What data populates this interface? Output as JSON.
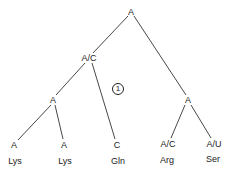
{
  "tree": {
    "nodes": {
      "root": {
        "label": "A"
      },
      "left_internal": {
        "label": "A/C"
      },
      "left_sub": {
        "label": "A"
      },
      "right_internal": {
        "label": "A"
      },
      "leaf1": {
        "label": "A",
        "amino_acid": "Lys"
      },
      "leaf2": {
        "label": "A",
        "amino_acid": "Lys"
      },
      "leaf3": {
        "label": "C",
        "amino_acid": "Gln"
      },
      "leaf4": {
        "label": "A/C",
        "amino_acid": "Arg"
      },
      "leaf5": {
        "label": "A/U",
        "amino_acid": "Ser"
      }
    },
    "annotation": "1",
    "line_color": "#333333"
  }
}
